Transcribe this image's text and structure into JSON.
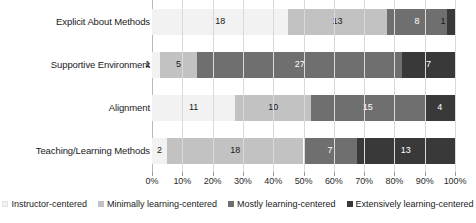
{
  "chart_data": {
    "type": "bar",
    "subtype": "stacked-horizontal-100-percent",
    "title": "",
    "subtitle": "",
    "xlabel": "",
    "ylabel": "",
    "grid": true,
    "legend_position": "bottom",
    "xlim": [
      0,
      100
    ],
    "xunit": "%",
    "categories": [
      "Explicit About Methods",
      "Supportive Environment",
      "Alignment",
      "Teaching/Learning Methods"
    ],
    "tick_labels": [
      "0%",
      "10%",
      "20%",
      "30%",
      "40%",
      "50%",
      "60%",
      "70%",
      "80%",
      "90%",
      "100%"
    ],
    "tick_values": [
      0,
      10,
      20,
      30,
      40,
      50,
      60,
      70,
      80,
      90,
      100
    ],
    "series": [
      {
        "name": "Instructor-centered",
        "color": "#f2f2f2",
        "values": [
          0,
          1,
          0,
          2
        ]
      },
      {
        "name": "Minimally learning-centered",
        "color": "#c2c2c2",
        "values": [
          18,
          5,
          11,
          18
        ]
      },
      {
        "name": "Mostly learning-centered",
        "color": "#6f6f6f",
        "values": [
          13,
          27,
          10,
          7
        ]
      },
      {
        "name": "Extensively learning-centered",
        "color": "#393939",
        "values": [
          8,
          7,
          15,
          13
        ]
      }
    ],
    "row_totals": [
      40,
      40,
      40,
      40
    ],
    "bars": [
      {
        "category": "Explicit About Methods",
        "segments": [
          {
            "series": "Instructor-centered",
            "value": 0,
            "label": "",
            "pct": 0.0,
            "color": "#f2f2f2"
          },
          {
            "series": "Minimally learning-centered",
            "value": 18,
            "label": "18",
            "pct": 45.0,
            "color": "#f2f2f2"
          },
          {
            "series": "Mostly learning-centered",
            "value": 13,
            "label": "13",
            "pct": 32.5,
            "color": "#c2c2c2"
          },
          {
            "series": "Extensively learning-centered",
            "value": 8,
            "label": "8",
            "pct": 20.0,
            "color": "#6f6f6f"
          },
          {
            "series": "Extensively learning-centered",
            "value": 1,
            "label": "1",
            "pct": 2.5,
            "color": "#393939"
          }
        ]
      },
      {
        "category": "Supportive Environment",
        "segments": [
          {
            "series": "Instructor-centered",
            "value": 1,
            "label": "1",
            "pct": 2.5,
            "color": "#f2f2f2"
          },
          {
            "series": "Minimally learning-centered",
            "value": 5,
            "label": "5",
            "pct": 12.5,
            "color": "#c2c2c2"
          },
          {
            "series": "Mostly learning-centered",
            "value": 27,
            "label": "27",
            "pct": 67.5,
            "color": "#6f6f6f"
          },
          {
            "series": "Extensively learning-centered",
            "value": 7,
            "label": "7",
            "pct": 17.5,
            "color": "#393939"
          }
        ]
      },
      {
        "category": "Alignment",
        "segments": [
          {
            "series": "Instructor-centered",
            "value": 0,
            "label": "",
            "pct": 0.0,
            "color": "#f2f2f2"
          },
          {
            "series": "Minimally learning-centered",
            "value": 11,
            "label": "11",
            "pct": 27.5,
            "color": "#f2f2f2"
          },
          {
            "series": "Mostly learning-centered",
            "value": 10,
            "label": "10",
            "pct": 25.0,
            "color": "#c2c2c2"
          },
          {
            "series": "Extensively learning-centered",
            "value": 15,
            "label": "15",
            "pct": 37.5,
            "color": "#6f6f6f"
          },
          {
            "series": "Extensively learning-centered",
            "value": 4,
            "label": "4",
            "pct": 10.0,
            "color": "#393939"
          }
        ]
      },
      {
        "category": "Teaching/Learning Methods",
        "segments": [
          {
            "series": "Instructor-centered",
            "value": 2,
            "label": "2",
            "pct": 5.0,
            "color": "#f2f2f2"
          },
          {
            "series": "Minimally learning-centered",
            "value": 18,
            "label": "18",
            "pct": 45.0,
            "color": "#c2c2c2"
          },
          {
            "series": "Mostly learning-centered",
            "value": 7,
            "label": "7",
            "pct": 17.5,
            "color": "#6f6f6f"
          },
          {
            "series": "Extensively learning-centered",
            "value": 13,
            "label": "13",
            "pct": 32.5,
            "color": "#393939"
          }
        ]
      }
    ]
  },
  "legend": {
    "items": [
      {
        "label": "Instructor-centered",
        "color": "#f2f2f2"
      },
      {
        "label": "Minimally learning-centered",
        "color": "#c2c2c2"
      },
      {
        "label": "Mostly learning-centered",
        "color": "#6f6f6f"
      },
      {
        "label": "Extensively learning-centered",
        "color": "#393939"
      }
    ]
  }
}
